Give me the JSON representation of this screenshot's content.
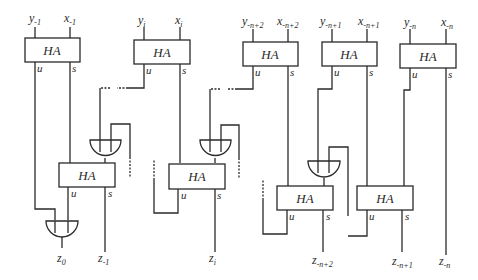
{
  "diagram": {
    "type": "half-adder array circuit",
    "block_label": "HA",
    "port_labels": {
      "carry": "u",
      "sum": "s"
    },
    "inputs": [
      {
        "y": "y-1",
        "x": "x-1",
        "y_base": "y",
        "y_sub": "-1",
        "x_base": "x",
        "x_sub": "-1"
      },
      {
        "y": "yi",
        "x": "xi",
        "y_base": "y",
        "y_sub": "i",
        "x_base": "x",
        "x_sub": "i"
      },
      {
        "y": "y-n+2",
        "x": "x-n+2",
        "y_base": "y",
        "y_sub": "-n+2",
        "x_base": "x",
        "x_sub": "-n+2"
      },
      {
        "y": "y-n+1",
        "x": "x-n+1",
        "y_base": "y",
        "y_sub": "-n+1",
        "x_base": "x",
        "x_sub": "-n+1"
      },
      {
        "y": "y-n",
        "x": "x-n",
        "y_base": "y",
        "y_sub": "-n",
        "x_base": "x",
        "x_sub": "-n"
      }
    ],
    "outputs": [
      {
        "label": "z0",
        "base": "z",
        "sub": "0"
      },
      {
        "label": "z-1",
        "base": "z",
        "sub": "-1"
      },
      {
        "label": "zi",
        "base": "z",
        "sub": "i"
      },
      {
        "label": "z-n+2",
        "base": "z",
        "sub": "-n+2"
      },
      {
        "label": "z-n+1",
        "base": "z",
        "sub": "-n+1"
      },
      {
        "label": "z-n",
        "base": "z",
        "sub": "-n"
      }
    ],
    "top_half_adders": 5,
    "bottom_half_adders": 4,
    "or_gates": 4
  }
}
